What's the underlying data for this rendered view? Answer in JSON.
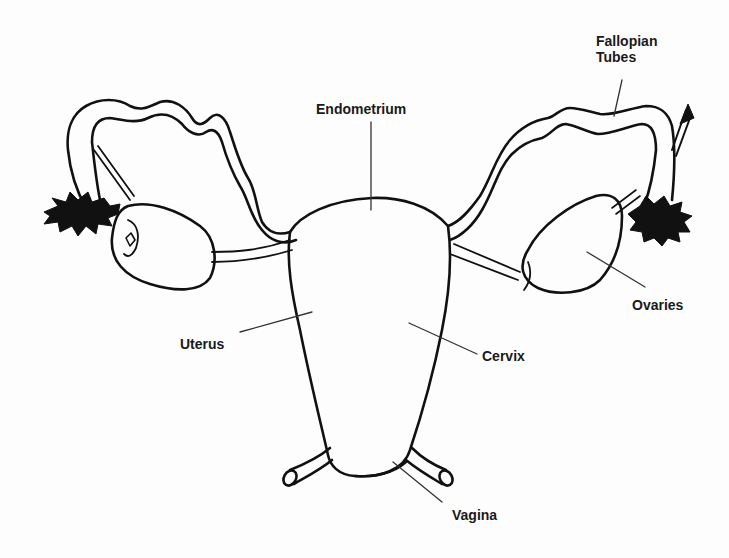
{
  "diagram": {
    "stroke_color": "#111111",
    "background_color": "#fdfdfd",
    "labels": [
      {
        "id": "fallopian-tubes",
        "text_line1": "Fallopian",
        "text_line2": "Tubes"
      },
      {
        "id": "endometrium",
        "text": "Endometrium"
      },
      {
        "id": "ovaries",
        "text": "Ovaries"
      },
      {
        "id": "uterus",
        "text": "Uterus"
      },
      {
        "id": "cervix",
        "text": "Cervix"
      },
      {
        "id": "vagina",
        "text": "Vagina"
      }
    ]
  }
}
